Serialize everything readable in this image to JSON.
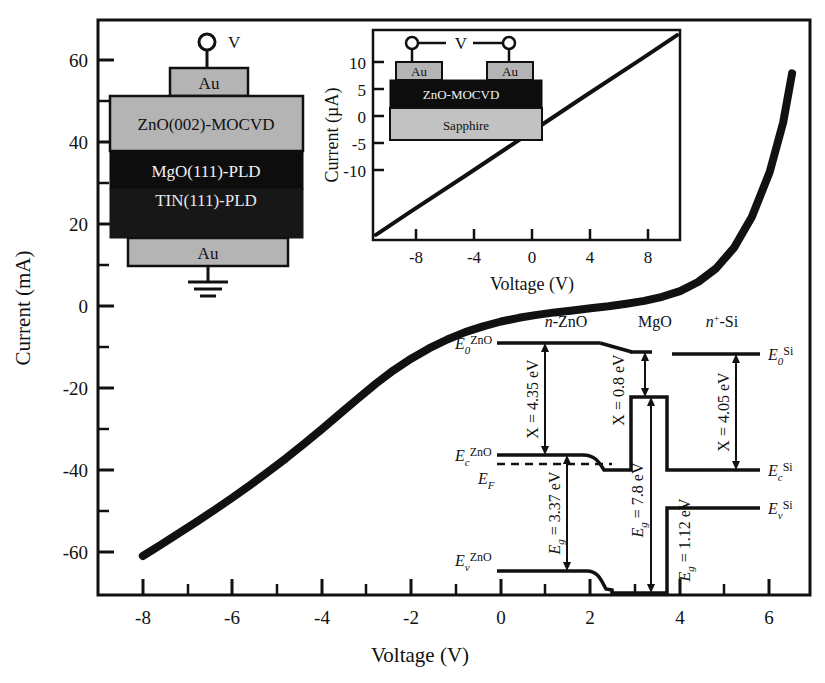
{
  "main_axes": {
    "xlabel": "Voltage (V)",
    "ylabel": "Current (mA)",
    "xticks": [
      "-8",
      "-6",
      "-4",
      "-2",
      "0",
      "2",
      "4",
      "6"
    ],
    "xtick_values": [
      -8,
      -6,
      -4,
      -2,
      0,
      2,
      4,
      6
    ],
    "yticks": [
      "60",
      "40",
      "20",
      "0",
      "-20",
      "-40",
      "-60"
    ],
    "ytick_values": [
      60,
      40,
      20,
      0,
      -20,
      -40,
      -60
    ],
    "xlim": [
      -9.0,
      6.9
    ],
    "ylim": [
      -70,
      70
    ],
    "curve_color": "#111111"
  },
  "inset_axes": {
    "xlabel": "Voltage (V)",
    "ylabel": "Current (µA)",
    "xticks": [
      "-8",
      "-4",
      "0",
      "4",
      "8"
    ],
    "xtick_values": [
      -8,
      -4,
      0,
      4,
      8
    ],
    "yticks": [
      "10",
      "5",
      "0",
      "-5",
      "-10"
    ],
    "ytick_values": [
      10,
      5,
      0,
      -5,
      -10
    ],
    "xlim": [
      -10.5,
      10.5
    ],
    "ylim": [
      -14,
      14
    ],
    "curve_color": "#111111"
  },
  "chart_data": [
    {
      "type": "line",
      "name": "main-iv-curve",
      "title": "Current (mA) vs Voltage (V)",
      "xlabel": "Voltage (V)",
      "ylabel": "Current (mA)",
      "xlim": [
        -9.0,
        6.9
      ],
      "ylim": [
        -70,
        70
      ],
      "xticks": [
        -8,
        -6,
        -4,
        -2,
        0,
        2,
        4,
        6
      ],
      "yticks": [
        60,
        40,
        20,
        0,
        -20,
        -40,
        -60
      ],
      "grid": false,
      "legend": null,
      "x": [
        -8.0,
        -7.6,
        -7.2,
        -6.8,
        -6.4,
        -6.0,
        -5.6,
        -5.2,
        -4.8,
        -4.4,
        -4.0,
        -3.6,
        -3.2,
        -2.8,
        -2.4,
        -2.0,
        -1.6,
        -1.2,
        -0.8,
        -0.4,
        0.0,
        0.4,
        0.8,
        1.2,
        1.6,
        2.0,
        2.4,
        2.8,
        3.2,
        3.6,
        4.0,
        4.4,
        4.8,
        5.2,
        5.6,
        6.0,
        6.3,
        6.5
      ],
      "y": [
        -60.5,
        -57.8,
        -55.0,
        -52.2,
        -49.3,
        -46.3,
        -43.2,
        -40.0,
        -36.7,
        -33.2,
        -29.6,
        -25.9,
        -22.2,
        -18.6,
        -15.3,
        -12.4,
        -9.9,
        -7.8,
        -6.0,
        -4.6,
        -3.4,
        -2.5,
        -1.8,
        -1.2,
        -0.7,
        -0.2,
        0.3,
        0.9,
        1.6,
        2.6,
        4.0,
        6.2,
        9.5,
        14.5,
        22.0,
        33.0,
        45.0,
        57.0
      ]
    },
    {
      "type": "line",
      "name": "inset-iv-curve",
      "title": "Current (µA) vs Voltage (V) — lateral ZnO on sapphire",
      "xlabel": "Voltage (V)",
      "ylabel": "Current (µA)",
      "xlim": [
        -10.5,
        10.5
      ],
      "ylim": [
        -14,
        14
      ],
      "xticks": [
        -8,
        -4,
        0,
        4,
        8
      ],
      "yticks": [
        10,
        5,
        0,
        -5,
        -10
      ],
      "grid": false,
      "legend": null,
      "x": [
        -10.3,
        -8,
        -4,
        0,
        4,
        8,
        10.3
      ],
      "y": [
        -13.3,
        -10.3,
        -5.2,
        0.0,
        5.2,
        10.3,
        13.3
      ]
    }
  ],
  "stack_inset": {
    "top_terminal_label": "V",
    "layers": [
      {
        "label": "Au",
        "fill": "#b4b4b4",
        "text": "#111111"
      },
      {
        "label": "ZnO(002)-MOCVD",
        "fill": "#b4b4b4",
        "text": "#111111"
      },
      {
        "label": "MgO(111)-PLD",
        "fill": "#0d0d0d",
        "text": "#f2f2f2"
      },
      {
        "label": "TIN(111)-PLD",
        "fill": "#171717",
        "text": "#e8e8e8"
      },
      {
        "label": "Au",
        "fill": "#b4b4b4",
        "text": "#111111"
      }
    ],
    "ground_symbol": "ground-icon"
  },
  "lateral_inset": {
    "bias_label": "V",
    "contact_left_label": "Au",
    "contact_right_label": "Au",
    "film_label": "ZnO-MOCVD",
    "substrate_label": "Sapphire",
    "film_fill": "#0d0d0d",
    "substrate_fill": "#c2c2c2",
    "contact_fill": "#b4b4b4"
  },
  "band_diagram": {
    "region_labels": [
      "n-ZnO",
      "MgO",
      "n+-Si"
    ],
    "region_label_n_zno": "n-ZnO",
    "region_label_mgo": "MgO",
    "region_label_n_si_prefix": "n",
    "region_label_n_si_sup": "+",
    "region_label_n_si_rest": "-Si",
    "levels": [
      {
        "symbol": "E",
        "sub": "0",
        "sup": "ZnO",
        "side": "left"
      },
      {
        "symbol": "E",
        "sub": "c",
        "sup": "ZnO",
        "side": "left"
      },
      {
        "symbol": "E",
        "sub": "F",
        "sup": "",
        "side": "left"
      },
      {
        "symbol": "E",
        "sub": "v",
        "sup": "ZnO",
        "side": "left"
      },
      {
        "symbol": "E",
        "sub": "0",
        "sup": "Si",
        "side": "right"
      },
      {
        "symbol": "E",
        "sub": "c",
        "sup": "Si",
        "side": "right"
      },
      {
        "symbol": "E",
        "sub": "v",
        "sup": "Si",
        "side": "right"
      }
    ],
    "annotations": [
      {
        "id": "chi-zno",
        "text": "X = 4.35 eV",
        "quantity": "electron affinity",
        "material": "ZnO",
        "value": 4.35,
        "unit": "eV"
      },
      {
        "id": "eg-zno",
        "text": "E g = 3.37 eV",
        "prefix": "E",
        "sub": "g",
        "rest": " = 3.37 eV",
        "quantity": "band gap",
        "material": "ZnO",
        "value": 3.37,
        "unit": "eV"
      },
      {
        "id": "chi-mgo",
        "text": "X = 0.8 eV",
        "quantity": "electron affinity",
        "material": "MgO",
        "value": 0.8,
        "unit": "eV"
      },
      {
        "id": "eg-mgo",
        "text": "E g = 7.8 eV",
        "prefix": "E",
        "sub": "g",
        "rest": " = 7.8 eV",
        "quantity": "band gap",
        "material": "MgO",
        "value": 7.8,
        "unit": "eV"
      },
      {
        "id": "chi-si",
        "text": "X = 4.05 eV",
        "quantity": "electron affinity",
        "material": "Si",
        "value": 4.05,
        "unit": "eV"
      },
      {
        "id": "eg-si",
        "text": "E g = 1.12 eV",
        "prefix": "E",
        "sub": "g",
        "rest": " = 1.12 eV",
        "quantity": "band gap",
        "material": "Si",
        "value": 1.12,
        "unit": "eV"
      }
    ],
    "chi_zno_text": "X = 4.35 eV",
    "chi_mgo_text": "X = 0.8 eV",
    "chi_si_text": "X = 4.05 eV",
    "eg_zno_text": " = 3.37 eV",
    "eg_mgo_text": " = 7.8 eV",
    "eg_si_text": " = 1.12 eV",
    "eg_symbol": "E",
    "eg_sub": "g"
  }
}
